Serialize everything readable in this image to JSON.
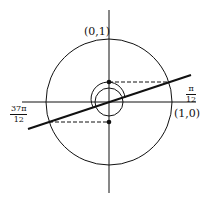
{
  "diagram": {
    "type": "unit-circle",
    "labels": {
      "top_point": "(0,1)",
      "right_point": "(1,0)",
      "angle_right": {
        "numerator": "π",
        "denominator": "12"
      },
      "angle_left": {
        "numerator": "37π",
        "denominator": "12"
      }
    },
    "colors": {
      "stroke": "#111111",
      "background": "#ffffff"
    }
  }
}
